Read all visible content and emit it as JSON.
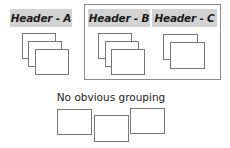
{
  "groups": {
    "a": {
      "header": "Header - A",
      "card_count": 3
    },
    "b": {
      "header": "Header - B",
      "card_count": 3
    },
    "c": {
      "header": "Header - C",
      "card_count": 2
    }
  },
  "ungrouped": {
    "caption": "No obvious grouping",
    "card_count": 3
  },
  "colors": {
    "header_bg": "#d2d2d2",
    "border": "#8a8a8a",
    "card_border": "#777777"
  }
}
